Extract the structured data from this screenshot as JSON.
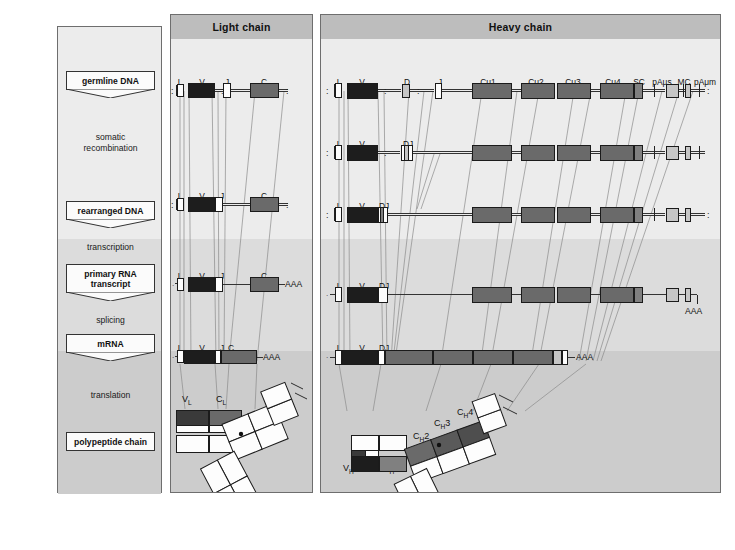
{
  "sidebar": {
    "stages": [
      {
        "id": "germline-dna",
        "label": "germline  DNA",
        "type": "tag"
      },
      {
        "id": "somatic-recombination",
        "label": "somatic\nrecombination",
        "line1": "somatic",
        "line2": "recombination",
        "type": "step"
      },
      {
        "id": "rearranged-dna",
        "label": "rearranged  DNA",
        "type": "tag"
      },
      {
        "id": "transcription",
        "label": "transcription",
        "type": "step"
      },
      {
        "id": "primary-rna-transcript",
        "label": "primary RNA\ntranscript",
        "line1": "primary RNA",
        "line2": "transcript",
        "type": "tag"
      },
      {
        "id": "splicing",
        "label": "splicing",
        "type": "step"
      },
      {
        "id": "mrna",
        "label": "mRNA",
        "type": "tag"
      },
      {
        "id": "translation",
        "label": "translation",
        "type": "step"
      },
      {
        "id": "polypeptide-chain",
        "label": "polypeptide chain",
        "type": "tag"
      }
    ]
  },
  "light_chain": {
    "header": "Light chain",
    "rows": {
      "germline": {
        "labels": [
          "L",
          "V",
          "J",
          "C"
        ],
        "left_dots": ":",
        "right_dots": ":"
      },
      "rearranged": {
        "labels": [
          "L",
          "V",
          "J",
          "C"
        ],
        "left_dots": ":",
        "right_dots": ":"
      },
      "primary_rna": {
        "labels": [
          "L",
          "V",
          "J",
          "C"
        ],
        "tail": "AAA"
      },
      "mrna": {
        "labels": [
          "L",
          "V",
          "J",
          "C"
        ],
        "tail": "AAA"
      }
    },
    "polypeptide": {
      "domains": [
        "V",
        "C"
      ],
      "labels": [
        "VL",
        "CL"
      ],
      "v_label_main": "V",
      "v_label_sub": "L",
      "c_label_main": "C",
      "c_label_sub": "L"
    }
  },
  "heavy_chain": {
    "header": "Heavy chain",
    "rows": {
      "germline": {
        "labels": [
          "L",
          "V",
          "D",
          "J",
          "Cμ1",
          "Cμ2",
          "Cμ3",
          "Cμ4",
          "SC",
          "pAμs",
          "MC",
          "pAμm"
        ],
        "left_dots": ":",
        "right_dots": ":"
      },
      "recombined": {
        "labels": [
          "L",
          "V",
          "DJ"
        ],
        "left_dots": ":",
        "right_dots": ":"
      },
      "rearranged": {
        "labels": [
          "L",
          "V",
          "DJ"
        ],
        "left_dots": ":",
        "right_dots": ":"
      },
      "primary_rna": {
        "labels": [
          "L",
          "V",
          "DJ"
        ],
        "tail": "AAA"
      },
      "mrna": {
        "labels": [
          "L",
          "V",
          "DJ"
        ],
        "tail": "AAA"
      }
    },
    "polypeptide": {
      "labels": [
        {
          "main": "V",
          "sub": "H"
        },
        {
          "main": "C",
          "sub": "H",
          "num": "1"
        },
        {
          "main": "C",
          "sub": "H",
          "num": "2"
        },
        {
          "main": "C",
          "sub": "H",
          "num": "3"
        },
        {
          "main": "C",
          "sub": "H",
          "num": "4"
        }
      ],
      "vh": "VH",
      "ch1": "CH1",
      "ch2": "CH2",
      "ch3": "CH3",
      "ch4": "CH4"
    }
  },
  "colors": {
    "panel_border": "#6e6e6e",
    "panel_header_bg": "#bdbdbd",
    "band_light": "#ececec",
    "band_mid": "#dcdcdc",
    "band_dark": "#cccccc",
    "segment_v": "#1d1d1d",
    "segment_c": "#6a6a6a",
    "segment_light": "#c6c6c6",
    "segment_white": "#fdfdfd",
    "connector": "#8b8b8b"
  }
}
